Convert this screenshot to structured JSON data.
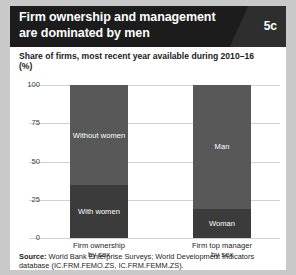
{
  "header": {
    "title_line1": "Firm ownership and management",
    "title_line2": "are dominated by men",
    "figure_number": "5c"
  },
  "subtitle": {
    "line1": "Share of firms, most recent year available during 2010–16",
    "line2": "(%)"
  },
  "source": {
    "label": "Source:",
    "text": " World Bank Enterprise Surveys; World Development Indicators database (IC.FRM.FEMO.ZS, IC.FRM.FEMM.ZS)."
  },
  "colors": {
    "segment_top": "#585858",
    "segment_bottom": "#3b3b3b",
    "header_background": "#1c1c1c",
    "badge_background": "#2e2e2e",
    "card_background": "#ffffff",
    "page_background": "#c9c9c9",
    "gridline": "#d2d2d2"
  },
  "chart_data": {
    "type": "bar",
    "title": "Firm ownership and management are dominated by men",
    "subtitle": "Share of firms, most recent year available during 2010–16 (%)",
    "xlabel": "",
    "ylabel": "(%)",
    "ylim": [
      0,
      100
    ],
    "yticks": [
      0,
      25,
      50,
      75,
      100
    ],
    "ytick_labels": [
      "0",
      "25",
      "50",
      "75",
      "100"
    ],
    "grid": true,
    "stacked": true,
    "legend": "none",
    "categories": [
      "Firm ownership by sex",
      "Firm top manager by sex"
    ],
    "category_lines": [
      [
        "Firm ownership",
        "by sex"
      ],
      [
        "Firm top manager",
        "by sex"
      ]
    ],
    "series": [
      {
        "name": "lower",
        "labels": [
          "With women",
          "Woman"
        ],
        "values": [
          34.6,
          19.0
        ]
      },
      {
        "name": "upper",
        "labels": [
          "Without women",
          "Man"
        ],
        "values": [
          65.4,
          81.0
        ]
      }
    ],
    "bars": [
      {
        "category": "Firm ownership by sex",
        "segments": [
          {
            "label": "Without women",
            "value": 65.4,
            "position": "top"
          },
          {
            "label": "With women",
            "value": 34.6,
            "position": "bottom"
          }
        ]
      },
      {
        "category": "Firm top manager by sex",
        "segments": [
          {
            "label": "Man",
            "value": 81.0,
            "position": "top"
          },
          {
            "label": "Woman",
            "value": 19.0,
            "position": "bottom"
          }
        ]
      }
    ]
  }
}
